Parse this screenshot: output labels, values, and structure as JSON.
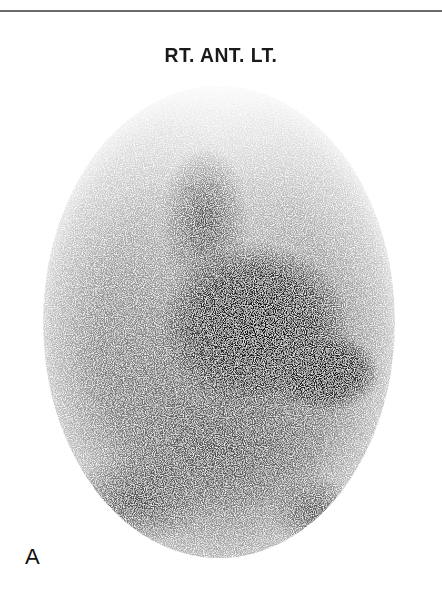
{
  "figure": {
    "title": "RT. ANT. LT.",
    "panel_label": "A",
    "image_description": "Grayscale anterior planar nuclear medicine scintigram in an oval field of view",
    "colors": {
      "background": "#ffffff",
      "ink": "#1a1a1a",
      "rule": "#6a6a6a"
    }
  }
}
